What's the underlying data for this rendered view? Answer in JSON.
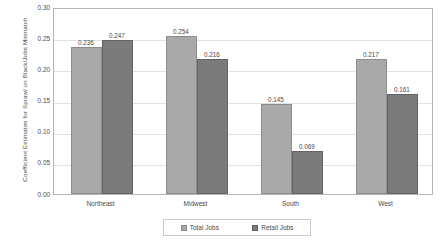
{
  "chart_data": {
    "type": "bar",
    "title": "",
    "xlabel": "",
    "ylabel": "Coefficient Estimates for Sprawl on Black/Jobs Mismatch",
    "categories": [
      "Northeast",
      "Midwest",
      "South",
      "West"
    ],
    "series": [
      {
        "name": "Total Jobs",
        "values": [
          0.236,
          0.254,
          0.145,
          0.217
        ],
        "color": "#a9a9a9"
      },
      {
        "name": "Retail Jobs",
        "values": [
          0.247,
          0.216,
          0.069,
          0.161
        ],
        "color": "#7b7b7b"
      }
    ],
    "ylim": [
      0.0,
      0.3
    ],
    "yticks": [
      "0.00",
      "0.05",
      "0.10",
      "0.15",
      "0.20",
      "0.25",
      "0.30"
    ],
    "ytick_values": [
      0.0,
      0.05,
      0.1,
      0.15,
      0.2,
      0.25,
      0.3
    ],
    "grid": true,
    "legend_position": "bottom",
    "value_labels": [
      [
        "0.236",
        "0.247"
      ],
      [
        "0.254",
        "0.216"
      ],
      [
        "0.145",
        "0.069"
      ],
      [
        "0.217",
        "0.161"
      ]
    ]
  },
  "legend": {
    "entries": [
      {
        "label": "Total Jobs"
      },
      {
        "label": "Retail Jobs"
      }
    ]
  },
  "caption": {
    "text": ""
  }
}
